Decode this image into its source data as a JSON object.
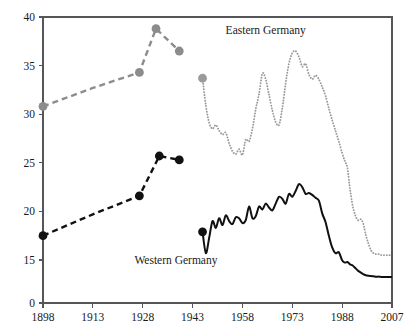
{
  "chart_data": {
    "type": "line",
    "title": "",
    "subtitle": "",
    "xlabel": "",
    "ylabel": "",
    "xlim": [
      1898,
      2007
    ],
    "ylim": [
      0,
      40
    ],
    "grid": false,
    "legend_position": "inline-annotations",
    "x_tick_labels": [
      "1898",
      "1913",
      "1928",
      "1943",
      "1958",
      "1973",
      "1988",
      "2007"
    ],
    "x_ticks": [
      1898,
      1913,
      1928,
      1943,
      1958,
      1973,
      1988,
      2007
    ],
    "y_tick_labels": [
      "0",
      "15",
      "20",
      "25",
      "30",
      "35",
      "40"
    ],
    "y_ticks": [
      0,
      15,
      20,
      25,
      30,
      35,
      40
    ],
    "y_axis_broken_between": [
      0,
      15
    ],
    "annotations": [
      {
        "text": "Eastern Germany",
        "x": 1965,
        "y": 38.2
      },
      {
        "text": "Western Germany",
        "x": 1938,
        "y": 13.6
      }
    ],
    "series": [
      {
        "name": "Eastern Germany (historical)",
        "color": "#8c8c8c",
        "style": "dashed",
        "markers": true,
        "x": [
          1898,
          1913,
          1927,
          1932,
          1939
        ],
        "y": [
          30.8,
          32.7,
          34.3,
          38.8,
          36.5
        ],
        "marker_x": [
          1898,
          1927,
          1932,
          1939
        ],
        "marker_y": [
          30.8,
          34.3,
          38.8,
          36.5
        ]
      },
      {
        "name": "Western Germany (historical)",
        "color": "#111111",
        "style": "dashed",
        "markers": true,
        "x": [
          1898,
          1913,
          1927,
          1933,
          1939
        ],
        "y": [
          17.5,
          19.7,
          21.6,
          25.7,
          25.3
        ],
        "marker_x": [
          1898,
          1927,
          1933,
          1939
        ],
        "marker_y": [
          17.5,
          21.6,
          25.7,
          25.3
        ]
      },
      {
        "name": "Eastern Germany (postwar)",
        "color": "#9a9a9a",
        "style": "dotted",
        "markers": true,
        "marker_x": [
          1946
        ],
        "marker_y": [
          33.7
        ],
        "x": [
          1946,
          1947,
          1948,
          1949,
          1950,
          1951,
          1952,
          1953,
          1954,
          1955,
          1956,
          1957,
          1958,
          1959,
          1960,
          1961,
          1962,
          1963,
          1964,
          1965,
          1966,
          1967,
          1968,
          1969,
          1970,
          1971,
          1972,
          1973,
          1974,
          1975,
          1976,
          1977,
          1978,
          1979,
          1980,
          1981,
          1982,
          1983,
          1984,
          1985,
          1986,
          1987,
          1988,
          1989,
          1990,
          1991,
          1992,
          1993,
          1994,
          1995,
          1996,
          1997,
          1998,
          1999,
          2000,
          2001,
          2002,
          2003,
          2004,
          2005,
          2006,
          2007
        ],
        "y": [
          33.7,
          30.9,
          29.1,
          28.5,
          28.9,
          28.3,
          27.9,
          28.1,
          27.0,
          26.2,
          25.9,
          26.4,
          25.8,
          27.4,
          27.2,
          28.5,
          30.5,
          32.1,
          34.2,
          33.6,
          32.0,
          30.4,
          29.2,
          28.9,
          30.6,
          33.2,
          35.2,
          36.3,
          36.5,
          35.9,
          34.9,
          35.2,
          34.1,
          33.6,
          34.0,
          33.6,
          32.8,
          31.9,
          30.6,
          29.4,
          28.3,
          27.2,
          26.0,
          25.2,
          24.5,
          22.3,
          20.6,
          19.6,
          19.1,
          19.2,
          18.8,
          17.6,
          16.7,
          16.0,
          15.7,
          15.6,
          15.6,
          15.5,
          15.5,
          15.5,
          15.5,
          15.5
        ]
      },
      {
        "name": "Western Germany (postwar)",
        "color": "#111111",
        "style": "solid",
        "markers": true,
        "marker_x": [
          1946
        ],
        "marker_y": [
          17.9
        ],
        "x": [
          1946,
          1947,
          1948,
          1949,
          1950,
          1951,
          1952,
          1953,
          1954,
          1955,
          1956,
          1957,
          1958,
          1959,
          1960,
          1961,
          1962,
          1963,
          1964,
          1965,
          1966,
          1967,
          1968,
          1969,
          1970,
          1971,
          1972,
          1973,
          1974,
          1975,
          1976,
          1977,
          1978,
          1979,
          1980,
          1981,
          1982,
          1983,
          1984,
          1985,
          1986,
          1987,
          1988,
          1989,
          1990,
          1991,
          1992,
          1993,
          1994,
          1995,
          1996,
          1997,
          1998,
          1999,
          2000,
          2001,
          2002,
          2003,
          2004,
          2005,
          2006,
          2007
        ],
        "y": [
          17.9,
          15.7,
          17.3,
          19.0,
          18.3,
          19.3,
          18.6,
          19.6,
          19.0,
          18.7,
          19.4,
          19.3,
          18.8,
          19.1,
          20.5,
          19.3,
          19.5,
          20.5,
          20.2,
          20.8,
          20.4,
          20.1,
          20.8,
          21.5,
          21.3,
          20.8,
          21.8,
          21.5,
          22.1,
          22.8,
          22.5,
          21.8,
          21.9,
          21.7,
          21.4,
          21.1,
          19.8,
          18.9,
          17.5,
          16.3,
          15.7,
          15.8,
          14.9,
          14.1,
          14.3,
          13.5,
          13.1,
          12.2,
          11.3,
          10.7,
          10.1,
          9.7,
          9.5,
          9.4,
          9.3,
          9.2,
          9.2,
          9.1,
          9.1,
          9.1,
          9.1,
          9.1
        ]
      }
    ]
  },
  "axes": {
    "x_labels": [
      "1898",
      "1913",
      "1928",
      "1943",
      "1958",
      "1973",
      "1988",
      "2007"
    ],
    "y_labels": [
      "40",
      "35",
      "30",
      "25",
      "20",
      "15",
      "0"
    ]
  },
  "labels": {
    "eastern": "Eastern Germany",
    "western": "Western Germany"
  }
}
